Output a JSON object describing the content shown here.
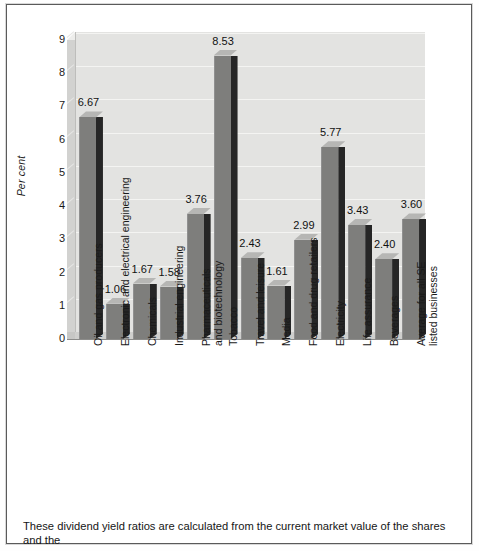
{
  "page": {
    "caption": "These dividend yield ratios are calculated from the current market value of the shares and the"
  },
  "chart_data": {
    "type": "bar",
    "title": "",
    "subtitle": "",
    "xlabel": "",
    "ylabel": "Per cent",
    "ylim": [
      0,
      9
    ],
    "ytick_labels": [
      "0",
      "1",
      "2",
      "3",
      "4",
      "5",
      "6",
      "7",
      "8",
      "9"
    ],
    "grid": true,
    "legend": "none",
    "style": "3d-column",
    "bar_color": "#7e7e7c",
    "bar_side_color": "#262626",
    "bar_top_color": "#b6b6b4",
    "plot_background": "#e3e3e1",
    "categories": [
      "Oil and gas producers",
      "Electronic and electrical engineering",
      "Chemicals",
      "Industrial engineering",
      "Pharmaceuticals and biotechnology",
      "Tobacco",
      "Travel and leisure",
      "Media",
      "Food and drug retailers",
      "Electricity",
      "Life assurance",
      "Beverages",
      "Average for all SE listed businesses"
    ],
    "category_lines": [
      [
        "Oil and gas producers"
      ],
      [
        "Electronic and electrical engineering"
      ],
      [
        "Chemicals"
      ],
      [
        "Industrial engineering"
      ],
      [
        "Pharmaceuticals",
        "and biotechnology"
      ],
      [
        "Tobacco"
      ],
      [
        "Travel and leisure"
      ],
      [
        "Media"
      ],
      [
        "Food and drug retailers"
      ],
      [
        "Electricity"
      ],
      [
        "Life assurance"
      ],
      [
        "Beverages"
      ],
      [
        "Average for all SE",
        "listed businesses"
      ]
    ],
    "values": [
      6.67,
      1.06,
      1.67,
      1.58,
      3.76,
      8.53,
      2.43,
      1.61,
      2.99,
      5.77,
      3.43,
      2.4,
      3.6
    ],
    "value_labels": [
      "6.67",
      "1.06",
      "1.67",
      "1.58",
      "3.76",
      "8.53",
      "2.43",
      "1.61",
      "2.99",
      "5.77",
      "3.43",
      "2.40",
      "3.60"
    ]
  }
}
